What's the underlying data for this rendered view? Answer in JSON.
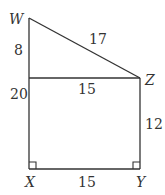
{
  "diagram": {
    "type": "geometry",
    "colors": {
      "stroke": "#333333",
      "background": "#ffffff"
    },
    "points": {
      "W": {
        "label": "W",
        "x": 29,
        "y": 18
      },
      "Z": {
        "label": "Z",
        "x": 140,
        "y": 78
      },
      "X": {
        "label": "X",
        "x": 29,
        "y": 169
      },
      "Y": {
        "label": "Y",
        "x": 140,
        "y": 169
      },
      "M": {
        "label": "",
        "x": 29,
        "y": 78
      }
    },
    "lengths": {
      "WM": "8",
      "WZ": "17",
      "MZ": "15",
      "WX": "20",
      "ZY": "12",
      "XY": "15"
    },
    "right_angles": [
      "X",
      "Y"
    ]
  }
}
